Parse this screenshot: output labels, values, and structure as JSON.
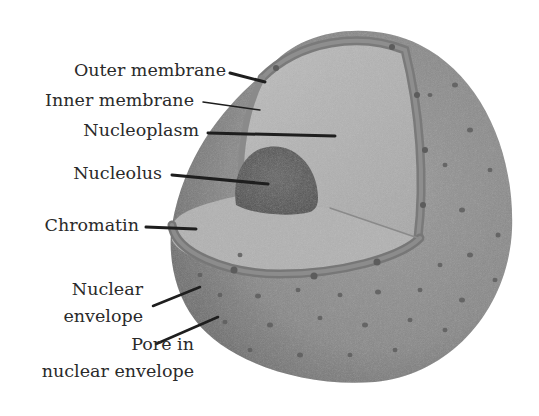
{
  "diagram": {
    "labels": {
      "outer_membrane": "Outer membrane",
      "inner_membrane": "Inner membrane",
      "nucleoplasm": "Nucleoplasm",
      "nucleolus": "Nucleolus",
      "chromatin": "Chromatin",
      "nuclear_envelope_line1": "Nuclear",
      "nuclear_envelope_line2": "envelope",
      "pore_line1": "Pore in",
      "pore_line2": "nuclear envelope"
    },
    "colors": {
      "outer_surface": "#8c8c8c",
      "cut_face": "#b0b0b0",
      "membrane_band": "#7d7d7d",
      "nucleolus": "#595959",
      "pores": "#5e5e5e",
      "leader_lines": "#1e1e1e",
      "text": "#2a2a2a",
      "background": "#ffffff"
    }
  }
}
